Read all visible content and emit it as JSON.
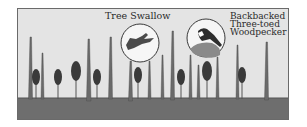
{
  "illustration": {
    "labels": {
      "tree_swallow": "Tree Swallow",
      "woodpecker_line1": "Backbacked",
      "woodpecker_line2": "Three-toed",
      "woodpecker_line3": "Woodpecker"
    },
    "colors": {
      "sky": "#e4e4e4",
      "ground": "#6e6e6e",
      "snag": "#6a6a6a",
      "tree": "#3a3a3a",
      "border": "#6a6a6a"
    },
    "snags_count": 13,
    "live_trees_count": 9
  }
}
